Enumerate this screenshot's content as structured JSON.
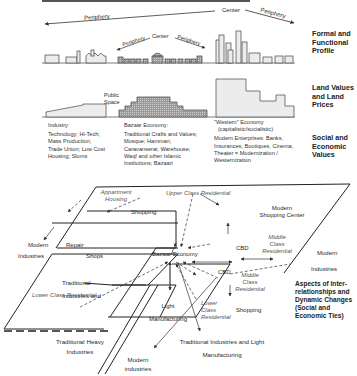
{
  "profile_section": {
    "top_arrow": {
      "left": "Periphery",
      "center": "Center",
      "right": "Periphery"
    },
    "bazaar_arrow": {
      "left": "Periphery",
      "center": "Center",
      "right": "Periphery"
    },
    "heading": "Formal and Functional Profile"
  },
  "land_values_section": {
    "public_space": "Public Space",
    "heading": "Land Values and Land Prices"
  },
  "social_section": {
    "heading": "Social and Economic Values",
    "columns": [
      {
        "title": "Industry:",
        "lines": [
          "Technology; Hi-Tech;",
          "Mass Production;",
          "Trade Union; Low Cost",
          "Housing; Slums"
        ]
      },
      {
        "title": "Bazaar Economy:",
        "lines": [
          "Traditional Crafts and Values;",
          "Mosque; Hamman;",
          "Caravanserai; Warehouse;",
          "Waqf and other Islamic",
          "Institutions; Bazaari"
        ]
      },
      {
        "title": "\"Western\" Economy",
        "lines": [
          "(capitalistic/socialistic)",
          "Modern Enterprises: Banks,",
          "Insurances, Boutiques, Cinema,",
          "Theater = Modernization /",
          "Westernization"
        ]
      }
    ]
  },
  "interrelations_section": {
    "heading": "Aspects of Inter-relationships and Dynamic Changes (Social and Economic Ties)",
    "labels": {
      "apartment_housing": "Appartment Housing",
      "shopping_top": "Shopping",
      "upper_class_residential": "Upper Class Residential",
      "modern_shopping_center": "Modern Shopping Center",
      "middle_class_residential_top": "Middle Class Residential",
      "cbd_top": "CBD",
      "modern_left": "Modern",
      "repair": "Repair",
      "industries_left": "Industries",
      "shops": "Shops",
      "traditional_industries_and": "Traditional Industries and",
      "lower_class_residential_left": "Lower Class Residential",
      "bazaar_economy": "Bazaar Economy",
      "light_manufacturing": "Light Manufacturing",
      "cbd_mid": "CBD",
      "middle_class_residential_mid": "Middle Class Residential",
      "lower_class_residential_mid": "Lower Class Residential",
      "shopping_mid": "Shopping",
      "modern_right": "Modern",
      "industries_right": "Industries",
      "traditional_heavy_industries": "Traditional Heavy Industries",
      "modern_industries": "Modern industries",
      "trad_industries_light_mfg": "Traditional Industries and Light Manufacturing"
    }
  }
}
